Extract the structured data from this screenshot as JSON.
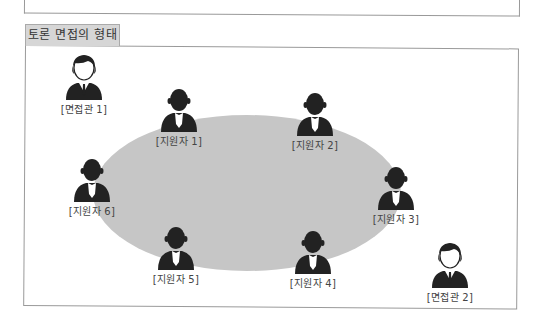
{
  "title": "토론 면접의 형태",
  "colors": {
    "table": "#c6c6c6",
    "figure": "#222222",
    "tab_bg": "#d6d6d6"
  },
  "interviewers": [
    {
      "label": "[면접관 1]",
      "icon": "interviewer-icon"
    },
    {
      "label": "[면접관 2]",
      "icon": "interviewer-icon"
    }
  ],
  "applicants": [
    {
      "label": "[지원자 1]",
      "icon": "applicant-icon"
    },
    {
      "label": "[지원자 2]",
      "icon": "applicant-icon"
    },
    {
      "label": "[지원자 3]",
      "icon": "applicant-icon"
    },
    {
      "label": "[지원자 4]",
      "icon": "applicant-icon"
    },
    {
      "label": "[지원자 5]",
      "icon": "applicant-icon"
    },
    {
      "label": "[지원자 6]",
      "icon": "applicant-icon"
    }
  ]
}
